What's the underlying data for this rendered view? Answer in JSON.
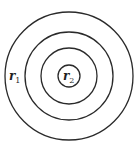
{
  "diagram": {
    "title": "",
    "type": "concentric-circles",
    "center": {
      "x": 69,
      "y": 76
    },
    "stroke_color": "#2a2a2a",
    "background_color": "#ffffff",
    "circles": [
      {
        "id": "ring-1",
        "radius": 64
      },
      {
        "id": "ring-2",
        "radius": 44
      },
      {
        "id": "ring-3",
        "radius": 28
      },
      {
        "id": "ring-4",
        "radius": 11
      }
    ],
    "labels": [
      {
        "id": "r1",
        "main": "r",
        "sub": "1",
        "x": 9,
        "y": 80
      },
      {
        "id": "r2",
        "main": "r",
        "sub": "2",
        "x": 63,
        "y": 80
      }
    ]
  }
}
